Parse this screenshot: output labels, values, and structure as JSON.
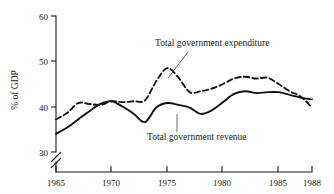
{
  "chart_data": {
    "type": "line",
    "title": "",
    "subtitle": "",
    "xlabel": "",
    "ylabel": "% of GDP",
    "xlim": [
      1965,
      1988
    ],
    "ylim": [
      30,
      60
    ],
    "yticks": [
      30,
      40,
      50,
      60
    ],
    "ytick_labels": [
      "30",
      "40",
      "50",
      "60"
    ],
    "xticks": [
      1965,
      1970,
      1975,
      1980,
      1985,
      1988
    ],
    "xtick_labels": [
      "1965",
      "1970",
      "1975",
      "1980",
      "1985",
      "1988"
    ],
    "grid": false,
    "axis_break": true,
    "axis_break_note": "y-axis broken below 30",
    "legend_position": "inline-annotations",
    "x": [
      1965,
      1966,
      1967,
      1968,
      1969,
      1970,
      1971,
      1972,
      1973,
      1974,
      1975,
      1976,
      1977,
      1978,
      1979,
      1980,
      1981,
      1982,
      1983,
      1984,
      1985,
      1986,
      1987,
      1988
    ],
    "series": [
      {
        "name": "Total government expenditure",
        "style": "dashed",
        "color": "#111111",
        "values": [
          37.2,
          38.6,
          40.8,
          40.6,
          40.4,
          41.2,
          41.0,
          41.2,
          41.4,
          45.6,
          48.5,
          46.4,
          43.2,
          43.4,
          44.0,
          45.0,
          46.2,
          46.6,
          46.2,
          46.4,
          45.0,
          43.4,
          42.2,
          39.8
        ]
      },
      {
        "name": "Total government revenue",
        "style": "solid",
        "color": "#111111",
        "values": [
          34.0,
          35.4,
          37.2,
          39.0,
          40.6,
          41.2,
          40.0,
          38.4,
          36.6,
          39.8,
          40.8,
          40.4,
          39.8,
          38.4,
          39.2,
          41.0,
          42.8,
          43.4,
          43.0,
          43.2,
          43.2,
          42.6,
          42.0,
          41.6
        ]
      }
    ],
    "annotations": [
      {
        "name": "expenditure-label",
        "text": "Total government expenditure",
        "x_px": 155,
        "y_px": 46,
        "leader_from": [
          188,
          52
        ],
        "leader_to": [
          168,
          78
        ]
      },
      {
        "name": "revenue-label",
        "text": "Total government revenue",
        "x_px": 147,
        "y_px": 140,
        "leader_from": [
          177,
          132
        ],
        "leader_to": [
          177,
          114
        ]
      }
    ]
  }
}
